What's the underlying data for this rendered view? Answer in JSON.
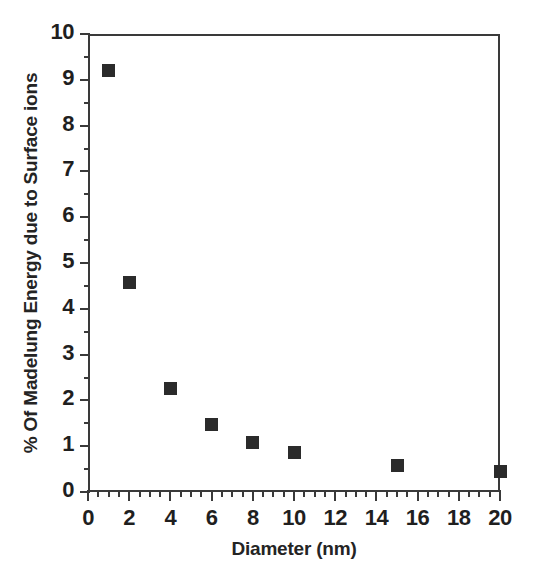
{
  "chart_data": {
    "type": "scatter",
    "title": "",
    "xlabel": "Diameter (nm)",
    "ylabel": "% Of Madelung Energy due to Surface ions",
    "xlim": [
      0,
      20
    ],
    "ylim": [
      0,
      10
    ],
    "grid": false,
    "legend": null,
    "x_major_tick_interval": 2,
    "x_minor_tick_interval": 0.5,
    "y_major_tick_interval": 1,
    "y_minor_tick_interval": 0.5,
    "xticks": [
      0,
      2,
      4,
      6,
      8,
      10,
      12,
      14,
      16,
      18,
      20
    ],
    "xticklabels": [
      "0",
      "2",
      "4",
      "6",
      "8",
      "10",
      "12",
      "14",
      "16",
      "18",
      "20"
    ],
    "yticks": [
      0,
      1,
      2,
      3,
      4,
      5,
      6,
      7,
      8,
      9,
      10
    ],
    "yticklabels": [
      "0",
      "1",
      "2",
      "3",
      "4",
      "5",
      "6",
      "7",
      "8",
      "9",
      "10"
    ],
    "marker": "filled-square",
    "marker_color": "#2b2b2b",
    "x": [
      1,
      2,
      4,
      6,
      8,
      10,
      15,
      20
    ],
    "values": [
      9.2,
      4.58,
      2.27,
      1.47,
      1.07,
      0.87,
      0.57,
      0.45
    ],
    "points": [
      {
        "x": 1,
        "y": 9.2
      },
      {
        "x": 2,
        "y": 4.58
      },
      {
        "x": 4,
        "y": 2.27
      },
      {
        "x": 6,
        "y": 1.47
      },
      {
        "x": 8,
        "y": 1.07
      },
      {
        "x": 10,
        "y": 0.87
      },
      {
        "x": 15,
        "y": 0.57
      },
      {
        "x": 20,
        "y": 0.45
      }
    ]
  }
}
